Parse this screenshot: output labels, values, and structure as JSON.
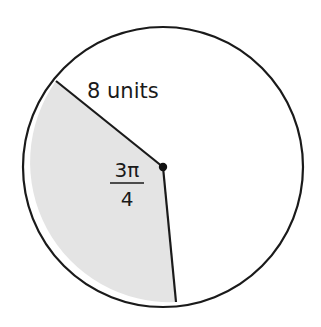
{
  "diagram": {
    "type": "circle-sector",
    "radius_label": "8 units",
    "angle_label": {
      "numerator": "3π",
      "denominator": "4"
    },
    "radius_value": 8,
    "central_angle_radians": "3π/4",
    "colors": {
      "stroke": "#1a1a1a",
      "sector_fill": "#e4e4e4",
      "background": "#ffffff"
    }
  }
}
